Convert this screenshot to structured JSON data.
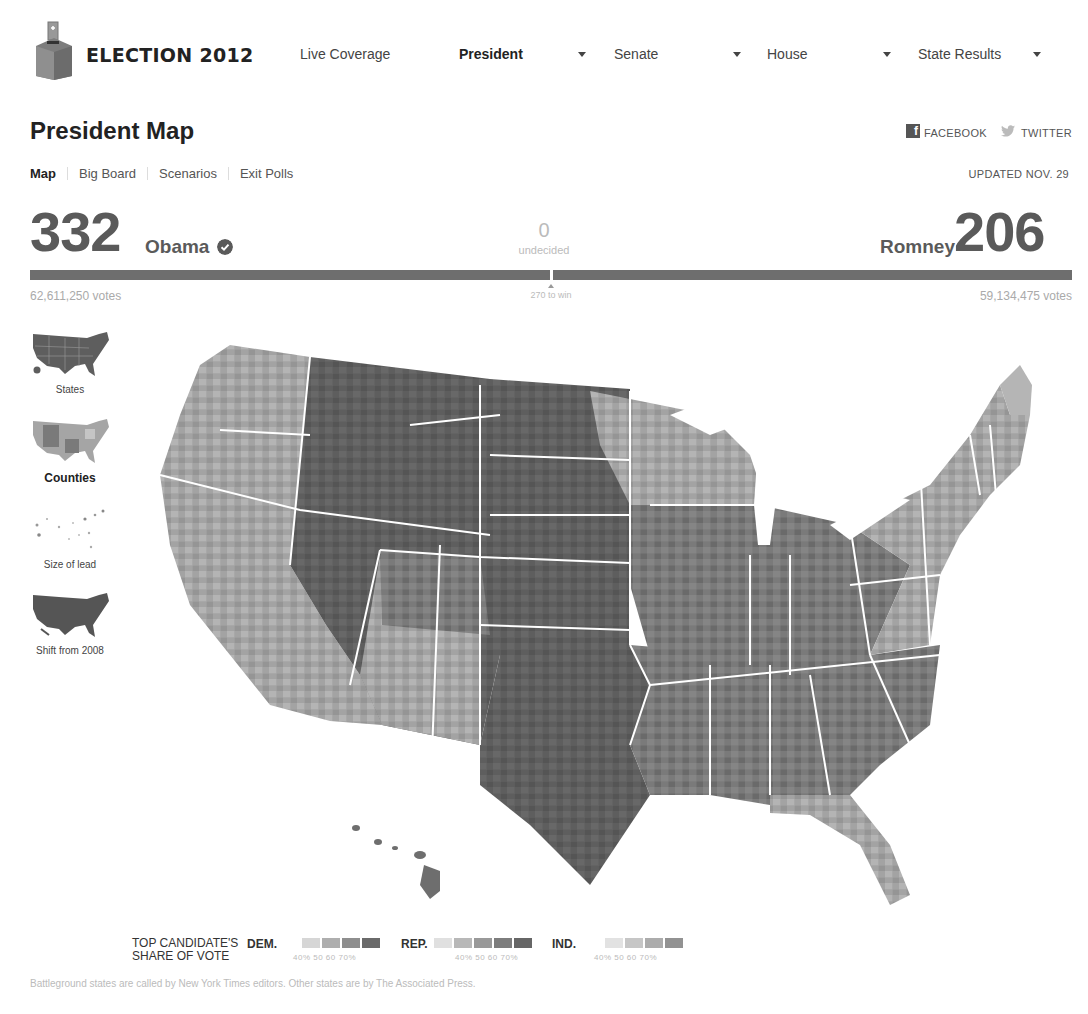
{
  "nav": {
    "brand": "ELECTION 2012",
    "items": [
      {
        "label": "Live Coverage",
        "bold": false,
        "dropdown": false
      },
      {
        "label": "President",
        "bold": true,
        "dropdown": true
      },
      {
        "label": "Senate",
        "bold": false,
        "dropdown": true
      },
      {
        "label": "House",
        "bold": false,
        "dropdown": true
      },
      {
        "label": "State Results",
        "bold": false,
        "dropdown": true
      }
    ]
  },
  "header": {
    "title": "President Map",
    "share": {
      "facebook": "FACEBOOK",
      "twitter": "TWITTER"
    },
    "updated": "UPDATED NOV. 29",
    "tabs": [
      {
        "label": "Map",
        "active": true
      },
      {
        "label": "Big Board",
        "active": false
      },
      {
        "label": "Scenarios",
        "active": false
      },
      {
        "label": "Exit Polls",
        "active": false
      }
    ]
  },
  "scoreboard": {
    "dem": {
      "electoral_votes": "332",
      "name": "Obama",
      "winner": true,
      "popular_votes": "62,611,250 votes"
    },
    "rep": {
      "electoral_votes": "206",
      "name": "Romney",
      "winner": false,
      "popular_votes": "59,134,475 votes"
    },
    "undecided": {
      "count": "0",
      "label": "undecided"
    },
    "threshold_label": "270 to win"
  },
  "views": [
    {
      "label": "States",
      "active": false
    },
    {
      "label": "Counties",
      "active": true
    },
    {
      "label": "Size of lead",
      "active": false
    },
    {
      "label": "Shift from 2008",
      "active": false
    }
  ],
  "map": {
    "title": "County-level results, top candidate's share of vote",
    "colors": {
      "background": "#ffffff",
      "state_border": "#ffffff",
      "dem_shades": [
        "#c8c8c8",
        "#a8a8a8",
        "#8a8a8a",
        "#6c6c6c"
      ],
      "rep_shades": [
        "#d0d0d0",
        "#9c9c9c",
        "#7c7c7c",
        "#646464",
        "#555555"
      ],
      "ind_shades": [
        "#d8d8d8",
        "#bcbcbc",
        "#a4a4a4",
        "#8e8e8e"
      ]
    }
  },
  "legend": {
    "title_line1": "TOP CANDIDATE'S",
    "title_line2": "SHARE OF VOTE",
    "parties": [
      {
        "label": "DEM.",
        "scale": "40%  50   60  70%"
      },
      {
        "label": "REP.",
        "scale": "40%  50   60  70%"
      },
      {
        "label": "IND.",
        "scale": "40%  50   60  70%"
      }
    ]
  },
  "footnote": "Battleground states are called by New York Times editors. Other states are by The Associated Press."
}
